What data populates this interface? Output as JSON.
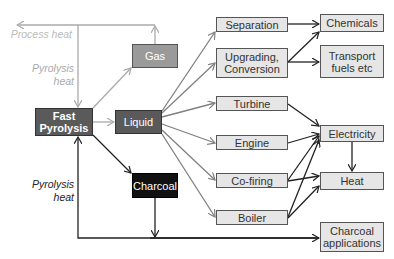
{
  "nodes": {
    "fast_pyrolysis": "Fast Pyrolysis",
    "liquid": "Liquid",
    "gas": "Gas",
    "charcoal": "Charcoal",
    "separation": "Separation",
    "upgrading": "Upgrading, Conversion",
    "turbine": "Turbine",
    "engine": "Engine",
    "cofiring": "Co-firing",
    "boiler": "Boiler",
    "chemicals": "Chemicals",
    "transport": "Transport fuels etc",
    "electricity": "Electricity",
    "heat": "Heat",
    "charcoal_apps": "Charcoal applications"
  },
  "labels": {
    "process_heat": "Process heat",
    "pyrolysis_heat_top": "Pyrolysis heat",
    "pyrolysis_heat_bottom": "Pyrolysis heat"
  },
  "colors": {
    "light_arrow": "#aaaaaa",
    "mid_arrow": "#808080",
    "dark_arrow": "#222222"
  }
}
